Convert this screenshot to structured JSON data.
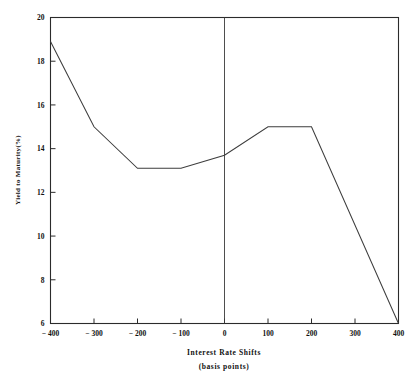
{
  "chart_data": {
    "type": "line",
    "title": "",
    "xlabel": "Interest Rate Shifts",
    "xlabel_sub": "(basis points)",
    "ylabel": "Yield to Maturity(%)",
    "xlim": [
      -400,
      400
    ],
    "ylim": [
      6,
      20
    ],
    "grid": false,
    "legend": "none",
    "x_ticks": [
      -400,
      -300,
      -200,
      -100,
      0,
      100,
      200,
      300,
      400
    ],
    "x_tick_labels": [
      "− 400",
      "− 300",
      "− 200",
      "− 100",
      "0",
      "100",
      "200",
      "300",
      "400"
    ],
    "y_ticks": [
      6,
      8,
      10,
      12,
      14,
      16,
      18,
      20
    ],
    "y_tick_labels": [
      "6",
      "8",
      "10",
      "12",
      "14",
      "16",
      "18",
      "20"
    ],
    "reference_lines": [
      {
        "name": "zero-shift-vertical",
        "orientation": "vertical",
        "x": 0
      }
    ],
    "series": [
      {
        "name": "yield-to-maturity",
        "x": [
          -400,
          -300,
          -200,
          -100,
          0,
          100,
          200,
          400
        ],
        "values": [
          18.9,
          15.0,
          13.1,
          13.1,
          13.7,
          15.0,
          15.0,
          6.0
        ]
      }
    ]
  },
  "colors": {
    "background": "#ffffff",
    "axis": "#2b2b2b",
    "line": "#3d3d3d",
    "text": "#111111"
  }
}
